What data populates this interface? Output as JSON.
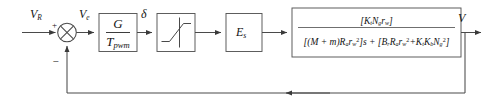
{
  "diagram": {
    "type": "block-diagram",
    "line_color": "#4a4a4a",
    "text_color": "#151515"
  },
  "signals": {
    "reference_input": "V",
    "reference_input_sub": "R",
    "error": "V",
    "error_sub": "e",
    "duty_cycle": "δ",
    "output": "V"
  },
  "summing_junction": {
    "name": "summing-junction",
    "plus_sign": "+",
    "minus_sign": "−"
  },
  "blocks": {
    "pwm_gain": {
      "numerator": "G",
      "denominator": "T",
      "denominator_sub": "pwm"
    },
    "saturation": {
      "label": "",
      "icon": "saturation-curve"
    },
    "supply_voltage": {
      "symbol": "E",
      "symbol_sub": "s"
    },
    "plant": {
      "numerator_open": "[",
      "numerator": "K",
      "numerator_sub1": "t",
      "numerator_2": "N",
      "numerator_sub2": "g",
      "numerator_3": "r",
      "numerator_sub3": "w",
      "numerator_close": "]",
      "numerator_full": "[K_t N_g r_w]",
      "denominator_full": "[(M + m)R_a r_w^2]s + [B_r R_a r_w^2 + K_t K_b N_g^2]"
    }
  },
  "feedback": {
    "path_label": "",
    "arrow": "leftward"
  }
}
